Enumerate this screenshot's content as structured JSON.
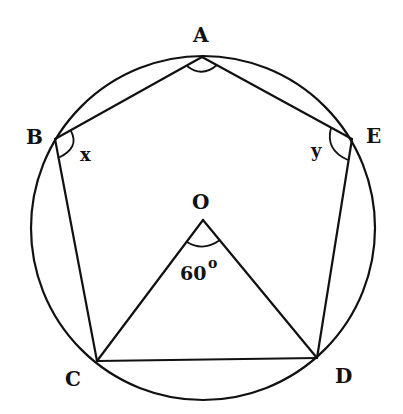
{
  "figure": {
    "vertices": {
      "A": "A",
      "B": "B",
      "C": "C",
      "D": "D",
      "E": "E",
      "O": "O"
    },
    "angles": {
      "x": "x",
      "y": "y",
      "cod_value": "60",
      "degree_symbol": "o"
    },
    "ink_color": "#111111",
    "background": "#ffffff"
  }
}
